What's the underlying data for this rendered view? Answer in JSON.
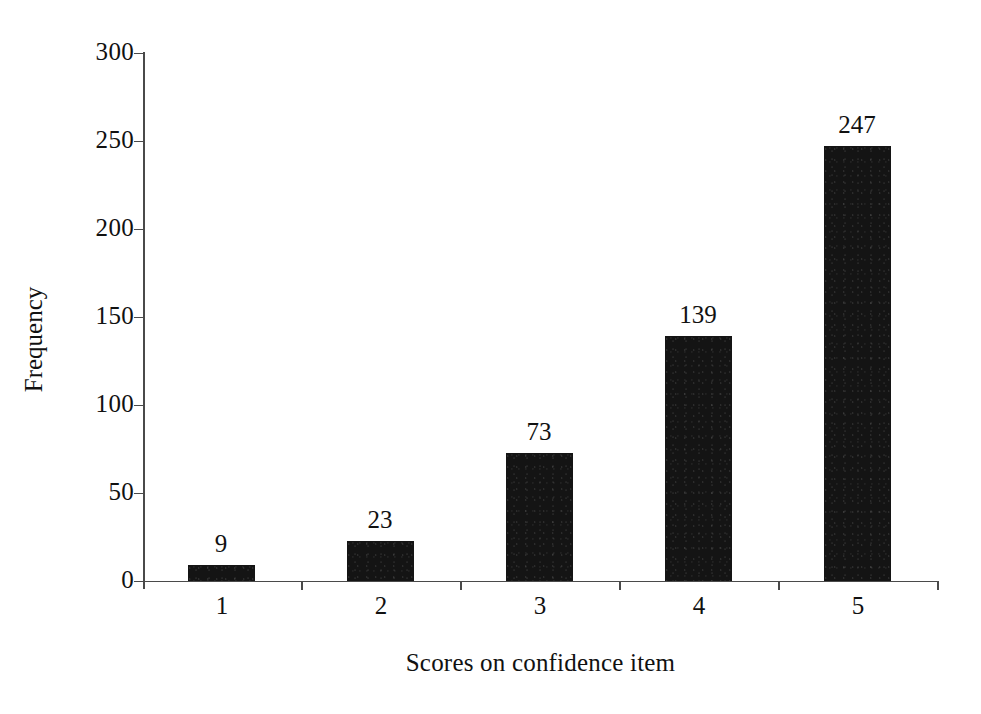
{
  "chart_data": {
    "type": "bar",
    "title": "",
    "subtitle": "",
    "xlabel": "Scores on confidence item",
    "ylabel": "Frequency",
    "categories": [
      "1",
      "2",
      "3",
      "4",
      "5"
    ],
    "values": [
      9,
      23,
      73,
      139,
      247
    ],
    "data_labels": [
      "9",
      "23",
      "73",
      "139",
      "247"
    ],
    "ylim": [
      0,
      300
    ],
    "ytick_labels": [
      "0",
      "50",
      "100",
      "150",
      "200",
      "250",
      "300"
    ],
    "ytick_values": [
      0,
      50,
      100,
      150,
      200,
      250,
      300
    ],
    "grid": false,
    "legend": null,
    "legend_position": "none",
    "series": [
      {
        "name": "Frequency",
        "values": [
          9,
          23,
          73,
          139,
          247
        ],
        "color": "#141414"
      }
    ],
    "annotations": []
  },
  "style": {
    "background_color": "#ffffff",
    "bar_color": "#141414",
    "axis_color": "#4a4a4a",
    "text_color": "#111111"
  }
}
